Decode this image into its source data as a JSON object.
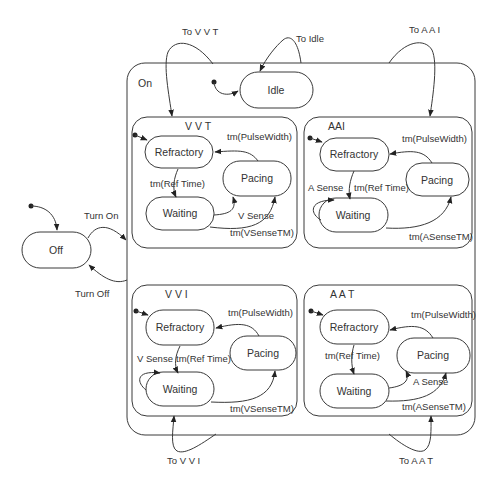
{
  "diagram": {
    "type": "statechart",
    "top_level_states": {
      "off": "Off",
      "on": "On"
    },
    "top_transitions": {
      "turn_on": "Turn On",
      "turn_off": "Turn Off",
      "to_vvt": "To V V T",
      "to_idle": "To Idle",
      "to_aai": "To A A I",
      "to_vvi": "To V V I",
      "to_aat": "To A A T"
    },
    "idle": "Idle",
    "modes": {
      "vvt": {
        "title": "V V T",
        "states": {
          "refractory": "Refractory",
          "pacing": "Pacing",
          "waiting": "Waiting"
        },
        "transitions": {
          "pulse": "tm(PulseWidth)",
          "ref": "tm(Ref Time)",
          "sense": "V Sense",
          "sensetm": "tm(VSenseTM)"
        }
      },
      "aai": {
        "title": "AAI",
        "states": {
          "refractory": "Refractory",
          "pacing": "Pacing",
          "waiting": "Waiting"
        },
        "transitions": {
          "pulse": "tm(PulseWidth)",
          "ref": "tm(Ref Time)",
          "sense": "A Sense",
          "sensetm": "tm(ASenseTM)"
        }
      },
      "vvi": {
        "title": "V V I",
        "states": {
          "refractory": "Refractory",
          "pacing": "Pacing",
          "waiting": "Waiting"
        },
        "transitions": {
          "pulse": "tm(PulseWidth)",
          "ref": "tm(Ref Time)",
          "sense": "V Sense",
          "sensetm": "tm(VSenseTM)"
        }
      },
      "aat": {
        "title": "A A T",
        "states": {
          "refractory": "Refractory",
          "pacing": "Pacing",
          "waiting": "Waiting"
        },
        "transitions": {
          "pulse": "tm(PulseWidth)",
          "ref": "tm(Ref Time)",
          "sense": "A Sense",
          "sensetm": "tm(ASenseTM)"
        }
      }
    }
  }
}
